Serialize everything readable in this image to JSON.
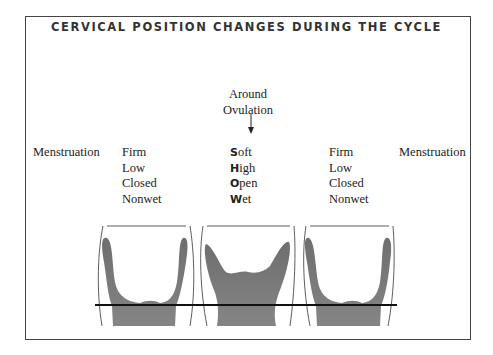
{
  "title": "CERVICAL POSITION CHANGES DURING THE CYCLE",
  "ovulation_label": [
    "Around",
    "Ovulation"
  ],
  "arrow_icon": "down-arrow",
  "phases": [
    {
      "label": "Menstruation",
      "attributes": [
        "Firm",
        "Low",
        "Closed",
        "Nonwet"
      ]
    },
    {
      "label": "Around Ovulation",
      "attributes": [
        "Soft",
        "High",
        "Open",
        "Wet"
      ],
      "mnemonic_initials": [
        "S",
        "H",
        "O",
        "W"
      ],
      "mnemonic_rest": [
        "oft",
        "igh",
        "pen",
        "et"
      ]
    },
    {
      "label": "Menstruation",
      "attributes": [
        "Firm",
        "Low",
        "Closed",
        "Nonwet"
      ]
    }
  ],
  "left_label": "Menstruation",
  "right_label": "Menstruation",
  "colors": {
    "cervix_fill": "#7a7a7a",
    "outline": "#333333",
    "reference_line": "#111111",
    "frame": "#444444"
  }
}
